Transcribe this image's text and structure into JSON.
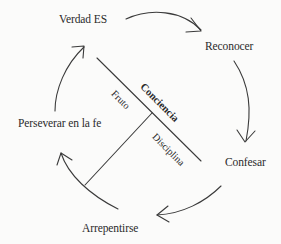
{
  "diagram": {
    "type": "cycle",
    "colors": {
      "background": "#fbfbfa",
      "line": "#3a3a3a",
      "text": "#2a2a2a"
    },
    "nodes": [
      {
        "id": "verdad",
        "label": "Verdad ES"
      },
      {
        "id": "reconocer",
        "label": "Reconocer"
      },
      {
        "id": "confesar",
        "label": "Confesar"
      },
      {
        "id": "arrepentirse",
        "label": "Arrepentirse"
      },
      {
        "id": "perseverar",
        "label": "Perseverar en la fe"
      }
    ],
    "cycle_order": [
      "Verdad ES",
      "Reconocer",
      "Confesar",
      "Arrepentirse",
      "Perseverar en la fe",
      "Verdad ES"
    ],
    "cross": {
      "main_axis_label": "Conciencia",
      "upper_branch_label": "Fruto",
      "lower_branch_label": "Disciplina"
    }
  }
}
